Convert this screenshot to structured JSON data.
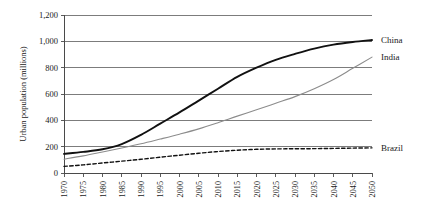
{
  "chart_data": {
    "type": "line",
    "title": "",
    "xlabel": "",
    "ylabel": "Urban population (millions)",
    "ylim": [
      0,
      1200
    ],
    "yticks": [
      "0",
      "200",
      "400",
      "600",
      "800",
      "1,000",
      "1,200"
    ],
    "ytick_values": [
      0,
      200,
      400,
      600,
      800,
      1000,
      1200
    ],
    "grid": "horizontal",
    "legend_position": "right-inline",
    "x": [
      1970,
      1975,
      1980,
      1985,
      1990,
      1995,
      2000,
      2005,
      2010,
      2015,
      2020,
      2025,
      2030,
      2035,
      2040,
      2045,
      2050
    ],
    "categories": [
      "1970",
      "1975",
      "1980",
      "1985",
      "1990",
      "1995",
      "2000",
      "2005",
      "2010",
      "2015",
      "2020",
      "2025",
      "2030",
      "2035",
      "2040",
      "2045",
      "2050"
    ],
    "series": [
      {
        "name": "China",
        "color": "#111111",
        "style": "solid",
        "width": 1.9,
        "values": [
          145,
          160,
          180,
          220,
          290,
          375,
          460,
          550,
          640,
          730,
          800,
          860,
          905,
          945,
          975,
          995,
          1010
        ]
      },
      {
        "name": "India",
        "color": "#8c8c8c",
        "style": "solid",
        "width": 1.1,
        "values": [
          105,
          130,
          160,
          190,
          222,
          258,
          295,
          335,
          382,
          432,
          480,
          530,
          580,
          640,
          710,
          795,
          880
        ]
      },
      {
        "name": "Brazil",
        "color": "#111111",
        "style": "dashed",
        "width": 1.4,
        "values": [
          50,
          62,
          76,
          90,
          104,
          120,
          135,
          150,
          163,
          173,
          180,
          183,
          184,
          185,
          187,
          189,
          191
        ]
      }
    ],
    "series_labels": [
      {
        "name": "China",
        "y_value": 1010
      },
      {
        "name": "India",
        "y_value": 880
      },
      {
        "name": "Brazil",
        "y_value": 191
      }
    ]
  }
}
